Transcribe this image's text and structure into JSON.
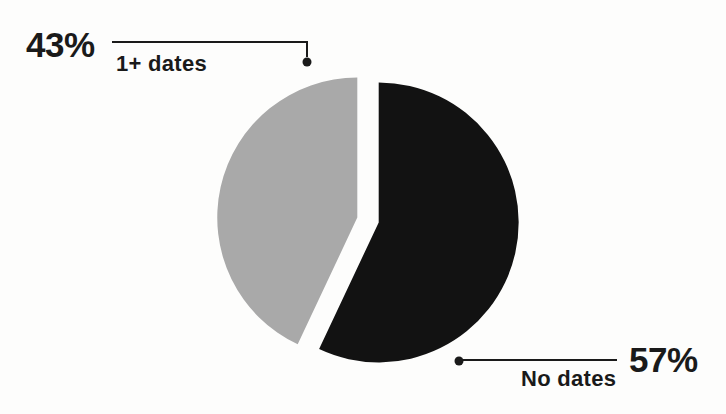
{
  "chart_data": {
    "type": "pie",
    "title": "",
    "slices": [
      {
        "label": "No dates",
        "value": 57,
        "display": "57%",
        "color": "#121212"
      },
      {
        "label": "1+ dates",
        "value": 43,
        "display": "43%",
        "color": "#a9a9a9"
      }
    ],
    "start_angle_deg": 0,
    "direction": "clockwise",
    "exploded": true,
    "legend_position": "callout-labels",
    "background": "#fdfdfc",
    "text_color": "#1a1a1a"
  }
}
